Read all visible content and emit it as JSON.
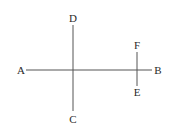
{
  "diagram": {
    "colors": {
      "background": "#ffffff",
      "line": "#555555",
      "label": "#2a2a2a"
    },
    "points": [
      {
        "id": "A",
        "label": "A",
        "x": 21,
        "y": 70
      },
      {
        "id": "B",
        "label": "B",
        "x": 158,
        "y": 70
      },
      {
        "id": "C",
        "label": "C",
        "x": 73,
        "y": 119
      },
      {
        "id": "D",
        "label": "D",
        "x": 73,
        "y": 18
      },
      {
        "id": "E",
        "label": "E",
        "x": 137,
        "y": 92
      },
      {
        "id": "F",
        "label": "F",
        "x": 137,
        "y": 45
      }
    ],
    "segments": [
      {
        "id": "AB",
        "from": "A",
        "to": "B",
        "x1": 26,
        "y1": 70,
        "x2": 152,
        "y2": 70
      },
      {
        "id": "DC",
        "from": "D",
        "to": "C",
        "x1": 73,
        "y1": 25,
        "x2": 73,
        "y2": 111
      },
      {
        "id": "FE",
        "from": "F",
        "to": "E",
        "x1": 137,
        "y1": 52,
        "x2": 137,
        "y2": 86
      }
    ],
    "intersections": [
      {
        "segments": [
          "AB",
          "DC"
        ],
        "x": 73,
        "y": 70
      },
      {
        "segments": [
          "AB",
          "FE"
        ],
        "x": 137,
        "y": 70
      }
    ]
  }
}
